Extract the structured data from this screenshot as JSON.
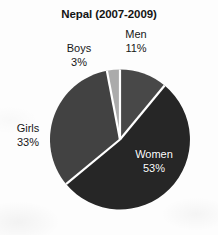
{
  "chart_data": {
    "type": "pie",
    "title": "Nepal (2007-2009)",
    "xlabel": "",
    "ylabel": "",
    "legend_position": "none",
    "grid": false,
    "categories": [
      "Men",
      "Women",
      "Girls",
      "Boys"
    ],
    "values": [
      11,
      53,
      33,
      3
    ],
    "unit": "%",
    "start_angle_deg": 0,
    "direction": "clockwise",
    "slices": [
      {
        "label": "Men",
        "value": 11,
        "value_text": "11%",
        "color": "#484848",
        "label_color": "#171717",
        "label_placement": "outside-top"
      },
      {
        "label": "Women",
        "value": 53,
        "value_text": "53%",
        "color": "#262626",
        "label_color": "#ffffff",
        "label_placement": "inside"
      },
      {
        "label": "Girls",
        "value": 33,
        "value_text": "33%",
        "color": "#424242",
        "label_color": "#171717",
        "label_placement": "outside-left"
      },
      {
        "label": "Boys",
        "value": 3,
        "value_text": "3%",
        "color": "#ababab",
        "label_color": "#171717",
        "label_placement": "outside-top-left"
      }
    ],
    "separator_color": "#ffffff",
    "background_color": "#fdfdfd"
  },
  "labels": {
    "men": {
      "name": "Men",
      "pct": "11%"
    },
    "women": {
      "name": "Women",
      "pct": "53%"
    },
    "girls": {
      "name": "Girls",
      "pct": "33%"
    },
    "boys": {
      "name": "Boys",
      "pct": "3%"
    }
  }
}
